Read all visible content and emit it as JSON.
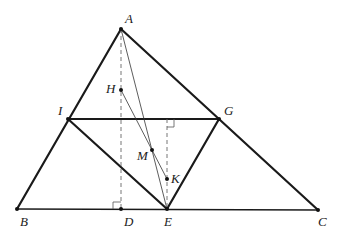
{
  "figure": {
    "type": "geometry",
    "points": {
      "A": {
        "label": "A"
      },
      "B": {
        "label": "B"
      },
      "C": {
        "label": "C"
      },
      "D": {
        "label": "D"
      },
      "E": {
        "label": "E"
      },
      "G": {
        "label": "G"
      },
      "I": {
        "label": "I"
      },
      "H": {
        "label": "H"
      },
      "M": {
        "label": "M"
      },
      "K": {
        "label": "K"
      }
    },
    "segments": {
      "thick": [
        "AB",
        "AC",
        "IG",
        "IE",
        "GE"
      ],
      "base": [
        "BC"
      ],
      "thin": [
        "AE",
        "HK"
      ],
      "dashed": [
        "AD",
        "K-to-IG"
      ]
    },
    "right_angles": [
      "ADB",
      "K-foot-on-IG"
    ]
  }
}
